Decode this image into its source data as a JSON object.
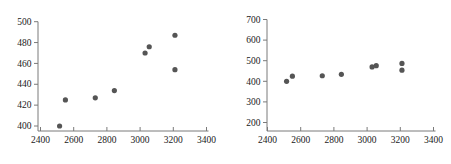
{
  "figure": {
    "background": "#ffffff",
    "point_color": "#555555",
    "axis_color": "#7a7a7a",
    "text_color": "#1a1a1a"
  },
  "chart_data": [
    {
      "id": "left-scatter",
      "type": "scatter",
      "title": "",
      "xlabel": "",
      "ylabel": "",
      "x": [
        2515,
        2550,
        2730,
        2845,
        3030,
        3055,
        3210,
        3210
      ],
      "y": [
        400,
        425,
        427,
        434,
        470,
        476,
        487,
        454
      ],
      "xlim": [
        2400,
        3400
      ],
      "ylim": [
        400,
        500
      ],
      "xticks": [
        2400,
        2600,
        2800,
        3000,
        3200,
        3400
      ],
      "yticks": [
        400,
        420,
        440,
        460,
        480,
        500
      ],
      "grid": false,
      "legend": "none"
    },
    {
      "id": "right-scatter",
      "type": "scatter",
      "title": "",
      "xlabel": "",
      "ylabel": "",
      "x": [
        2515,
        2550,
        2730,
        2845,
        3030,
        3055,
        3210,
        3210
      ],
      "y": [
        400,
        425,
        427,
        434,
        470,
        476,
        487,
        454
      ],
      "xlim": [
        2400,
        3400
      ],
      "ylim": [
        200,
        700
      ],
      "xticks": [
        2400,
        2600,
        2800,
        3000,
        3200,
        3400
      ],
      "yticks": [
        200,
        300,
        400,
        500,
        600,
        700
      ],
      "grid": false,
      "legend": "none"
    }
  ]
}
